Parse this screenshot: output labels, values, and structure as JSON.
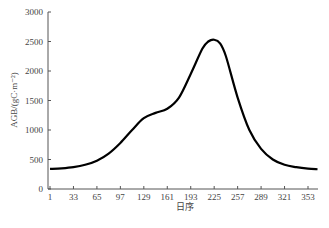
{
  "chart_data": {
    "type": "line",
    "title": "",
    "xlabel": "日序",
    "ylabel": "AGB/(gC·m⁻²)",
    "xlim": [
      1,
      366
    ],
    "ylim": [
      0,
      3000
    ],
    "xticks": [
      1,
      33,
      65,
      97,
      129,
      161,
      193,
      225,
      257,
      289,
      321,
      353
    ],
    "yticks": [
      0,
      500,
      1000,
      1500,
      2000,
      2500,
      3000
    ],
    "grid": false,
    "legend": null,
    "series": [
      {
        "name": "AGB",
        "color": "#000000",
        "x": [
          1,
          17,
          33,
          49,
          65,
          81,
          97,
          113,
          129,
          145,
          161,
          177,
          193,
          209,
          217,
          225,
          233,
          241,
          257,
          273,
          289,
          305,
          321,
          337,
          353,
          366
        ],
        "y": [
          340,
          350,
          370,
          410,
          480,
          600,
          780,
          1000,
          1200,
          1290,
          1360,
          1550,
          1950,
          2380,
          2500,
          2530,
          2470,
          2250,
          1550,
          1000,
          680,
          500,
          410,
          370,
          345,
          335
        ]
      }
    ]
  }
}
